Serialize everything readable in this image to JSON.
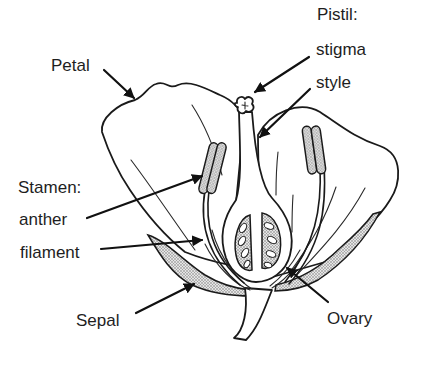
{
  "diagram": {
    "labels": {
      "petal": "Petal",
      "pistil": "Pistil:",
      "stigma": "stigma",
      "style": "style",
      "stamen": "Stamen:",
      "anther": "anther",
      "filament": "filament",
      "sepal": "Sepal",
      "ovary": "Ovary"
    },
    "groups": [
      {
        "name": "Pistil",
        "parts": [
          "stigma",
          "style",
          "ovary"
        ]
      },
      {
        "name": "Stamen",
        "parts": [
          "anther",
          "filament"
        ]
      }
    ],
    "colors": {
      "ink": "#1a1a1a",
      "background": "#ffffff",
      "stipple": "#8a8a8a"
    }
  }
}
